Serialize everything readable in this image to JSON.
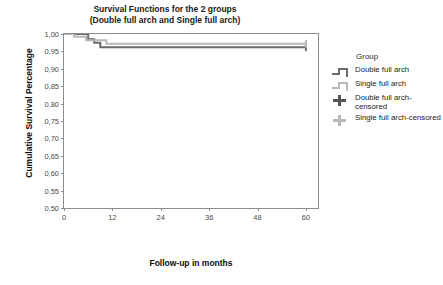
{
  "chart_data": {
    "type": "line",
    "subtype": "kaplan-meier-step",
    "title": "Survival Functions for the 2 groups",
    "subtitle": "(Double full arch and Single full arch)",
    "xlabel": "Follow-up in months",
    "ylabel": "Cumulative Survival Percentage",
    "xlim": [
      0,
      63
    ],
    "ylim": [
      0.5,
      1.0
    ],
    "xticks": [
      "0",
      "12",
      "24",
      "36",
      "48",
      "60"
    ],
    "xtick_values": [
      0,
      12,
      24,
      36,
      48,
      60
    ],
    "yticks": [
      "1,00",
      "0,95",
      "0,90",
      "0,85",
      "0,80",
      "0,75",
      "0,70",
      "0,65",
      "0,60",
      "0,55",
      "0,50"
    ],
    "ytick_values": [
      1.0,
      0.95,
      0.9,
      0.85,
      0.8,
      0.75,
      0.7,
      0.65,
      0.6,
      0.55,
      0.5
    ],
    "grid": false,
    "legend_position": "right",
    "legend_title": "Group",
    "series": [
      {
        "name": "Double full arch",
        "color": "#6b6b6b",
        "censored_label": "Double full arch-censored",
        "steps": [
          {
            "t": 0.0,
            "s": 1.0
          },
          {
            "t": 6.0,
            "s": 0.985
          },
          {
            "t": 7.5,
            "s": 0.975
          },
          {
            "t": 9.0,
            "s": 0.962
          },
          {
            "t": 60.0,
            "s": 0.962
          }
        ],
        "censored_points": [
          {
            "t": 60.0,
            "s": 0.962
          }
        ],
        "final_survival": 0.962
      },
      {
        "name": "Single full arch",
        "color": "#b8b8b8",
        "censored_label": "Single full arch-censored",
        "steps": [
          {
            "t": 0.0,
            "s": 1.0
          },
          {
            "t": 2.5,
            "s": 0.992
          },
          {
            "t": 5.5,
            "s": 0.982
          },
          {
            "t": 10.5,
            "s": 0.972
          },
          {
            "t": 60.0,
            "s": 0.972
          }
        ],
        "censored_points": [
          {
            "t": 60.0,
            "s": 0.972
          }
        ],
        "final_survival": 0.972
      }
    ]
  },
  "legend": {
    "title": "Group",
    "entries": [
      {
        "label": "Double full arch",
        "glyph": "step",
        "color": "#6b6b6b"
      },
      {
        "label": "Single full arch",
        "glyph": "step",
        "color": "#b8b8b8"
      },
      {
        "label": "Double full arch-censored",
        "glyph": "plus",
        "color": "#555555"
      },
      {
        "label": "Single full arch-censored",
        "glyph": "plus",
        "color": "#b8b8b8"
      }
    ]
  },
  "colors": {
    "double_arch": "#6b6b6b",
    "single_arch": "#b8b8b8",
    "axis": "#8c8c8c",
    "text": "#1a1a1a",
    "tick_text": "#4a4a4a",
    "background": "#ffffff"
  }
}
